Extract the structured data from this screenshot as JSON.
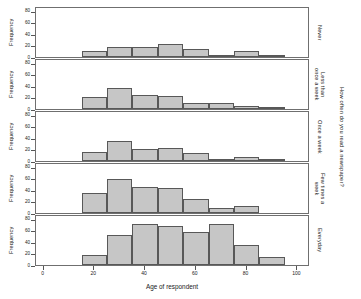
{
  "chart_data": {
    "type": "bar",
    "chart_kind": "trellis-histogram",
    "title": "",
    "xlabel": "Age of respondent",
    "ylabel": "Frequency",
    "xlim": [
      -3,
      105
    ],
    "ylim": [
      0,
      88
    ],
    "xticks": [
      0,
      20,
      40,
      60,
      80,
      100
    ],
    "yticks": [
      0,
      20,
      40,
      60,
      80
    ],
    "grid": false,
    "legend": false,
    "bin_width": 10,
    "bin_starts": [
      15,
      25,
      35,
      45,
      55,
      65,
      75,
      85
    ],
    "bin_labels": [
      "15-25",
      "25-35",
      "35-45",
      "45-55",
      "55-65",
      "65-75",
      "75-85",
      "85-95"
    ],
    "outer_strip_label": "How often do you read a newspaper?",
    "bar_fill": "#c6c6c6",
    "bar_stroke": "#585858",
    "panel_order_top_to_bottom": [
      "Never",
      "Less than once a week",
      "Once a week",
      "Few times a week",
      "Everyday"
    ],
    "panels": [
      {
        "strip_label": "Never",
        "strip_label_display": "Never",
        "values": [
          11,
          17,
          18,
          23,
          13,
          4,
          10,
          2
        ]
      },
      {
        "strip_label": "Less than once a week",
        "strip_label_display": "Less than\nonce a week",
        "values": [
          21,
          36,
          25,
          23,
          10,
          11,
          5,
          2
        ]
      },
      {
        "strip_label": "Once a week",
        "strip_label_display": "Once a week",
        "values": [
          15,
          34,
          21,
          23,
          13,
          4,
          7,
          2
        ]
      },
      {
        "strip_label": "Few times a week",
        "strip_label_display": "Few times a\nweek",
        "values": [
          34,
          59,
          45,
          44,
          25,
          9,
          12,
          0
        ]
      },
      {
        "strip_label": "Everyday",
        "strip_label_display": "Everyday",
        "values": [
          18,
          52,
          70,
          67,
          57,
          70,
          35,
          13
        ]
      }
    ]
  },
  "axes": {
    "ylabel": "Frequency",
    "xlabel": "Age of respondent",
    "xtick_labels": [
      "0",
      "20",
      "40",
      "60",
      "80",
      "100"
    ],
    "ytick_labels": [
      "0",
      "20",
      "40",
      "60",
      "80"
    ]
  }
}
